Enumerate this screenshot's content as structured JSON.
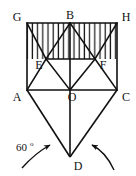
{
  "figure": {
    "background_color": "#ffffff",
    "stroke_color": "#111111",
    "hatch_color": "#1a1a1a",
    "labels": {
      "g": "G",
      "b": "B",
      "h": "H",
      "e": "E",
      "f": "F",
      "a": "A",
      "o": "O",
      "c": "C",
      "d": "D"
    },
    "annotations": {
      "angle_value": "60",
      "angle_unit": "o"
    },
    "points": {
      "G": [
        27,
        23
      ],
      "B": [
        70,
        23
      ],
      "H": [
        117,
        23
      ],
      "E": [
        46,
        59
      ],
      "F": [
        95,
        59
      ],
      "A": [
        27,
        90
      ],
      "O": [
        70,
        90
      ],
      "C": [
        117,
        90
      ],
      "D": [
        70,
        157
      ]
    }
  }
}
